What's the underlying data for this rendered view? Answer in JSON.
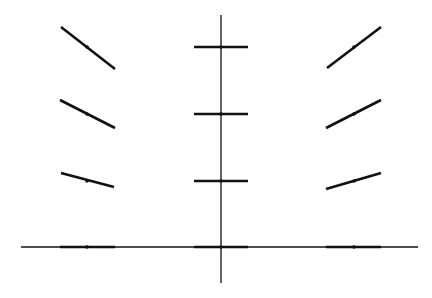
{
  "diagram": {
    "type": "slope-field",
    "background": "#ffffff",
    "stroke_color": "#111111",
    "axes": {
      "x_axis": {
        "x1": 21,
        "y1": 247,
        "x2": 418,
        "y2": 247,
        "width": 1.3
      },
      "y_axis": {
        "x1": 221,
        "y1": 15,
        "x2": 221,
        "y2": 283,
        "width": 1.3
      }
    },
    "segment_width": 2.6,
    "dot_radius": 1.8,
    "segments": [
      {
        "cx": 87,
        "cy": 47,
        "x1": 61,
        "y1": 27,
        "x2": 115,
        "y2": 69
      },
      {
        "cx": 87,
        "cy": 114,
        "x1": 60,
        "y1": 100,
        "x2": 115,
        "y2": 128
      },
      {
        "cx": 87,
        "cy": 181,
        "x1": 61,
        "y1": 173,
        "x2": 114,
        "y2": 187
      },
      {
        "cx": 87,
        "cy": 247,
        "x1": 60,
        "y1": 247,
        "x2": 115,
        "y2": 247
      },
      {
        "cx": 221,
        "cy": 47,
        "x1": 194,
        "y1": 47,
        "x2": 248,
        "y2": 47
      },
      {
        "cx": 221,
        "cy": 114,
        "x1": 194,
        "y1": 114,
        "x2": 248,
        "y2": 114
      },
      {
        "cx": 221,
        "cy": 181,
        "x1": 194,
        "y1": 181,
        "x2": 248,
        "y2": 181
      },
      {
        "cx": 221,
        "cy": 247,
        "x1": 194,
        "y1": 247,
        "x2": 248,
        "y2": 247
      },
      {
        "cx": 354,
        "cy": 47,
        "x1": 327,
        "y1": 68,
        "x2": 381,
        "y2": 27
      },
      {
        "cx": 354,
        "cy": 114,
        "x1": 326,
        "y1": 128,
        "x2": 381,
        "y2": 100
      },
      {
        "cx": 354,
        "cy": 181,
        "x1": 326,
        "y1": 189,
        "x2": 381,
        "y2": 173
      },
      {
        "cx": 354,
        "cy": 247,
        "x1": 326,
        "y1": 247,
        "x2": 381,
        "y2": 247
      }
    ]
  }
}
